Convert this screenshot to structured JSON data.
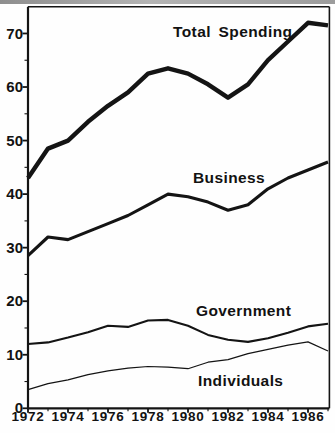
{
  "figure": {
    "background": "#fefefe",
    "line_color": "#141414",
    "scan_edge_color": "#9e9e9e"
  },
  "chart_data": {
    "type": "line",
    "title": "",
    "xlabel": "",
    "ylabel": "",
    "grid": "off",
    "legend": "inline-annotations",
    "xlim": [
      1972,
      1987.1
    ],
    "ylim": [
      0,
      75
    ],
    "x": [
      1972,
      1973,
      1974,
      1975,
      1976,
      1977,
      1978,
      1979,
      1980,
      1981,
      1982,
      1983,
      1984,
      1985,
      1986,
      1987
    ],
    "x_major_ticks": [
      1972,
      1974,
      1976,
      1978,
      1980,
      1982,
      1984,
      1986
    ],
    "x_minor_ticks": [
      1973,
      1975,
      1977,
      1979,
      1981,
      1983,
      1985,
      1987
    ],
    "y_major_ticks": [
      0,
      10,
      20,
      30,
      40,
      50,
      60,
      70
    ],
    "y_minor_ticks": [
      5,
      15,
      25,
      35,
      45,
      55,
      65
    ],
    "series": [
      {
        "name": "Total Spending",
        "stroke_width": 4.4,
        "values": [
          43,
          48.5,
          50,
          53.5,
          56.5,
          59,
          62.5,
          63.5,
          62.5,
          60.5,
          58,
          60.5,
          65,
          68.5,
          72,
          71.5
        ]
      },
      {
        "name": "Business",
        "stroke_width": 3.1,
        "values": [
          28.5,
          32,
          31.5,
          33,
          34.5,
          36,
          38,
          40,
          39.5,
          38.5,
          37,
          38,
          41,
          43,
          44.5,
          46
        ]
      },
      {
        "name": "Government",
        "stroke_width": 2.1,
        "values": [
          12,
          12.3,
          13.2,
          14.2,
          15.4,
          15.2,
          16.4,
          16.5,
          15.4,
          13.7,
          12.8,
          12.4,
          13.1,
          14.1,
          15.3,
          15.8
        ]
      },
      {
        "name": "Individuals",
        "stroke_width": 1.2,
        "values": [
          3.5,
          4.6,
          5.3,
          6.3,
          7.0,
          7.5,
          7.8,
          7.7,
          7.4,
          8.6,
          9.1,
          10.2,
          11.0,
          11.8,
          12.4,
          10.7
        ]
      }
    ]
  }
}
